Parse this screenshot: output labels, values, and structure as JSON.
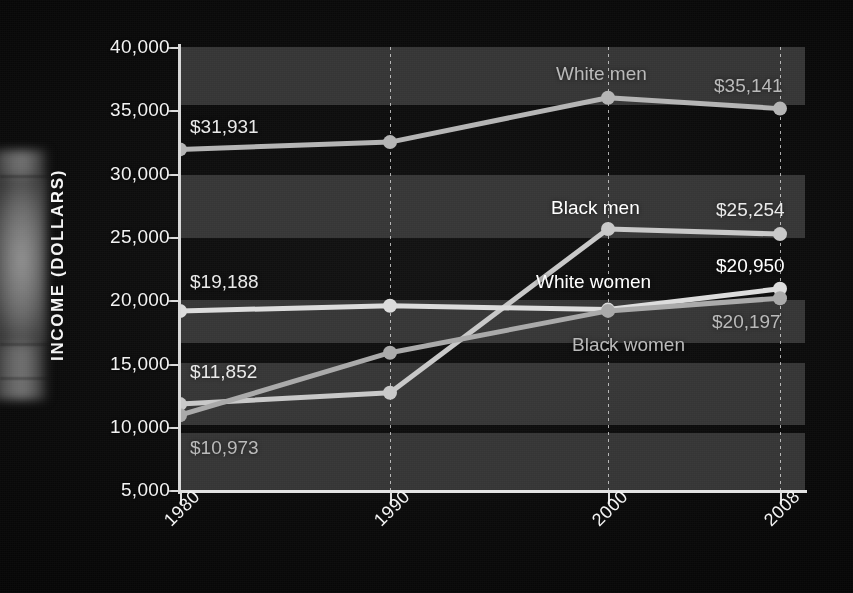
{
  "chart_data": {
    "type": "line",
    "title": "",
    "xlabel": "",
    "ylabel": "INCOME (DOLLARS)",
    "x": [
      "1980",
      "1990",
      "2000",
      "2008"
    ],
    "xtick_labels": [
      "1980",
      "1990",
      "2000",
      "2008"
    ],
    "ytick_labels": [
      "40,000",
      "35,000",
      "30,000",
      "25,000",
      "20,000",
      "15,000",
      "10,000",
      "5,000"
    ],
    "ytick_values": [
      40000,
      35000,
      30000,
      25000,
      20000,
      15000,
      10000,
      5000
    ],
    "ylim": [
      5000,
      40000
    ],
    "grid": "vertical-dotted",
    "legend": "inline-labels",
    "banded_background": true,
    "series": [
      {
        "name": "White men",
        "values": [
          31931,
          32500,
          36000,
          35141
        ],
        "start_label": "$31,931",
        "end_label": "$35,141",
        "color": "#b4b4b4"
      },
      {
        "name": "Black men",
        "values": [
          11852,
          12750,
          25650,
          25254
        ],
        "start_label": "$11,852",
        "end_label": "$25,254",
        "color": "#c8c8c8"
      },
      {
        "name": "White women",
        "values": [
          19188,
          19600,
          19300,
          20950
        ],
        "start_label": "$19,188",
        "end_label": "$20,950",
        "color": "#dcdcdc"
      },
      {
        "name": "Black women",
        "values": [
          10973,
          15900,
          19200,
          20197
        ],
        "start_label": "$10,973",
        "end_label": "$20,197",
        "color": "#a9a9a9"
      }
    ],
    "annotations": [
      {
        "text": "White men",
        "kind": "series-name"
      },
      {
        "text": "Black men",
        "kind": "series-name"
      },
      {
        "text": "White women",
        "kind": "series-name"
      },
      {
        "text": "Black women",
        "kind": "series-name"
      },
      {
        "text": "$31,931",
        "kind": "value"
      },
      {
        "text": "$35,141",
        "kind": "value"
      },
      {
        "text": "$19,188",
        "kind": "value"
      },
      {
        "text": "$11,852",
        "kind": "value"
      },
      {
        "text": "$10,973",
        "kind": "value"
      },
      {
        "text": "$25,254",
        "kind": "value"
      },
      {
        "text": "$20,950",
        "kind": "value"
      },
      {
        "text": "$20,197",
        "kind": "value"
      }
    ],
    "colors": {
      "background": "#070707",
      "band": "#3a3a3a",
      "axis": "#e2e2e2",
      "text_bright": "#f4f4f4",
      "text_dim": "#b9b9b9"
    }
  },
  "axis": {
    "y_title": "INCOME (DOLLARS)",
    "y_ticks": [
      "40,000",
      "35,000",
      "30,000",
      "25,000",
      "20,000",
      "15,000",
      "10,000",
      "5,000"
    ],
    "x_ticks": [
      "1980",
      "1990",
      "2000",
      "2008"
    ]
  },
  "labels": {
    "white_men": "White men",
    "black_men": "Black men",
    "white_women": "White women",
    "black_women": "Black women",
    "wm_start": "$31,931",
    "wm_end": "$35,141",
    "bm_end": "$25,254",
    "ww_start": "$19,188",
    "ww_end": "$20,950",
    "bm_start": "$11,852",
    "bw_start": "$10,973",
    "bw_end": "$20,197"
  }
}
